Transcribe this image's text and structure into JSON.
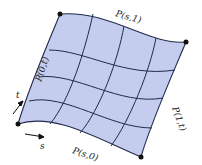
{
  "diagram": {
    "type": "bilinear-surface-patch",
    "fill_color": "#c5cdef",
    "line_color": "#1f2a4a",
    "edge_labels": {
      "top": "P(s,1)",
      "left": "P(0,t)",
      "right": "P(1,t)",
      "bottom": "P(s,0)"
    },
    "axes": {
      "s": "s",
      "t": "t"
    },
    "grid_divisions": 4
  }
}
